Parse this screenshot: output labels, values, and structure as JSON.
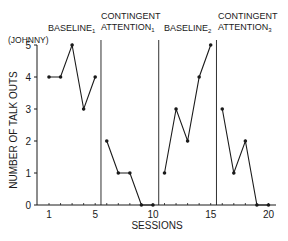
{
  "chart_data": {
    "type": "line",
    "title": "",
    "subject_label": "(JOHNNY)",
    "xlabel": "SESSIONS",
    "ylabel": "NUMBER OF TALK OUTS",
    "xlim": [
      1,
      20
    ],
    "ylim": [
      0,
      5
    ],
    "x_ticks": [
      1,
      5,
      10,
      15,
      20
    ],
    "y_ticks": [
      0,
      1,
      2,
      3,
      4,
      5
    ],
    "grid": false,
    "legend": "none",
    "phase_change_lines_after_session": [
      5,
      10,
      15
    ],
    "phases": [
      {
        "name": "BASELINE",
        "subscript": "1",
        "sessions": [
          1,
          2,
          3,
          4,
          5
        ],
        "values": [
          4,
          4,
          5,
          3,
          4
        ]
      },
      {
        "name": "CONTINGENT ATTENTION",
        "subscript": "1",
        "sessions": [
          6,
          7,
          8,
          9,
          10
        ],
        "values": [
          2,
          1,
          1,
          0,
          0
        ]
      },
      {
        "name": "BASELINE",
        "subscript": "2",
        "sessions": [
          11,
          12,
          13,
          14,
          15
        ],
        "values": [
          1,
          3,
          2,
          4,
          5
        ]
      },
      {
        "name": "CONTINGENT ATTENTION",
        "subscript": "3",
        "sessions": [
          16,
          17,
          18,
          19,
          20
        ],
        "values": [
          3,
          1,
          2,
          0,
          0
        ]
      }
    ]
  },
  "labels": {
    "subject": "(JOHNNY)",
    "xlabel": "SESSIONS",
    "ylabel": "NUMBER OF TALK OUTS",
    "phase1": "BASELINE",
    "phase1_sub": "1",
    "phase2_line1": "CONTINGENT",
    "phase2_line2": "ATTENTION",
    "phase2_sub": "1",
    "phase3": "BASELINE",
    "phase3_sub": "2",
    "phase4_line1": "CONTINGENT",
    "phase4_line2": "ATTENTION",
    "phase4_sub": "3"
  },
  "ticks": {
    "x": [
      "1",
      "5",
      "10",
      "15",
      "20"
    ],
    "y": [
      "0",
      "1",
      "2",
      "3",
      "4",
      "5"
    ]
  }
}
